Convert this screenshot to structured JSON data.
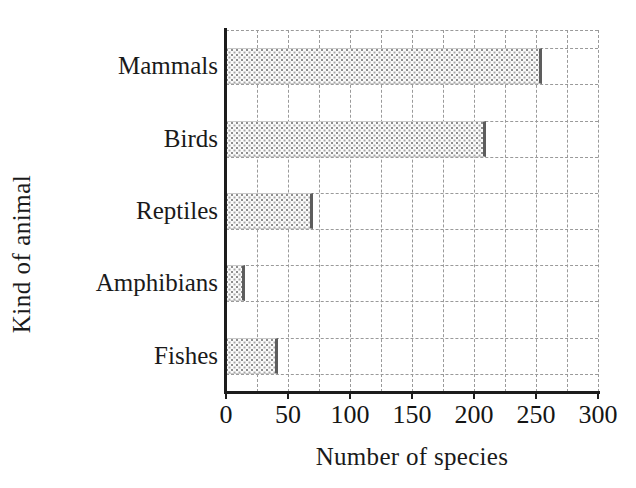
{
  "chart_data": {
    "type": "bar",
    "orientation": "horizontal",
    "title": "",
    "xlabel": "Number of species",
    "ylabel": "Kind of animal",
    "categories": [
      "Mammals",
      "Birds",
      "Reptiles",
      "Amphibians",
      "Fishes"
    ],
    "values": [
      255,
      210,
      70,
      15,
      42
    ],
    "series": [
      {
        "name": "Number of species",
        "values": [
          255,
          210,
          70,
          15,
          42
        ]
      }
    ],
    "xlim": [
      0,
      300
    ],
    "xticks": [
      0,
      50,
      100,
      150,
      200,
      250,
      300
    ],
    "xticklabels": [
      "0",
      "50",
      "100",
      "150",
      "200",
      "250",
      "300"
    ],
    "x_minor_gridline_step": 25,
    "grid": true,
    "grid_style": "dashed",
    "legend": false,
    "legend_position": "none",
    "bar_fill": "stippled-dots",
    "colors": {
      "axis": "#1c1c1c",
      "grid": "#9a9a9a",
      "bar_fill": "#fbfbfb",
      "bar_dots": "#9a9a9a",
      "bar_edge": "#5d5d5d",
      "text": "#1a1a1a",
      "background": "#ffffff"
    }
  },
  "figure": {
    "cut_off_title": "",
    "axis_title_x": "Number of species",
    "axis_title_y": "Kind of animal"
  }
}
